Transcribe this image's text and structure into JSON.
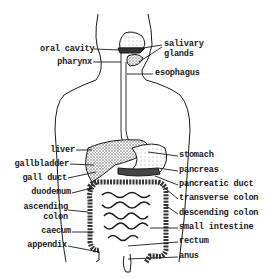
{
  "diagram": {
    "type": "anatomical-labeled-diagram",
    "colors": {
      "ink": "#1a1a1a",
      "background": "#ffffff",
      "stipple": "#555555"
    },
    "labels_left": [
      {
        "id": "oral-cavity",
        "text": "oral cavity"
      },
      {
        "id": "pharynx",
        "text": "pharynx"
      },
      {
        "id": "liver",
        "text": "liver"
      },
      {
        "id": "gallbladder",
        "text": "gallbladder"
      },
      {
        "id": "gall-duct",
        "text": "gall duct"
      },
      {
        "id": "duodenum",
        "text": "duodenum"
      },
      {
        "id": "ascending-colon-1",
        "text": "ascending"
      },
      {
        "id": "ascending-colon-2",
        "text": "colon"
      },
      {
        "id": "caecum",
        "text": "caecum"
      },
      {
        "id": "appendix",
        "text": "appendix"
      }
    ],
    "labels_right": [
      {
        "id": "salivary-glands-1",
        "text": "salivary"
      },
      {
        "id": "salivary-glands-2",
        "text": "glands"
      },
      {
        "id": "esophagus",
        "text": "esophagus"
      },
      {
        "id": "stomach",
        "text": "stomach"
      },
      {
        "id": "pancreas",
        "text": "pancreas"
      },
      {
        "id": "pancreatic-duct",
        "text": "pancreatic duct"
      },
      {
        "id": "transverse-colon",
        "text": "transverse colon"
      },
      {
        "id": "descending-colon",
        "text": "descending colon"
      },
      {
        "id": "small-intestine",
        "text": "small intestine"
      },
      {
        "id": "rectum",
        "text": "rectum"
      },
      {
        "id": "anus",
        "text": "anus"
      }
    ]
  }
}
